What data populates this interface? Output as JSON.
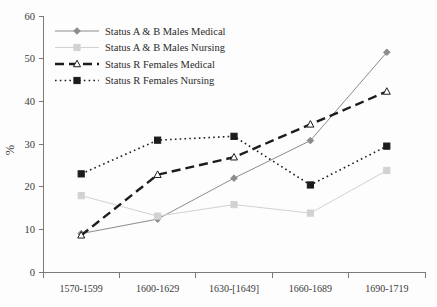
{
  "chart_data": {
    "type": "line",
    "title": "",
    "subtitle": "",
    "xlabel": "",
    "ylabel": "%",
    "categories": [
      "1570-1599",
      "1600-1629",
      "1630-[1649]",
      "1660-1689",
      "1690-1719"
    ],
    "ylim": [
      0,
      60
    ],
    "yticks": [
      0,
      10,
      20,
      30,
      40,
      50,
      60
    ],
    "ytick_labels": [
      "0",
      "10",
      "20",
      "30",
      "40",
      "50",
      "60"
    ],
    "grid": false,
    "legend_position": "top-left",
    "series": [
      {
        "name": "Status A & B Males Medical",
        "values": [
          9.0,
          12.4,
          22.0,
          30.8,
          51.5
        ],
        "color": "#8c8c8c",
        "line_style": "solid",
        "line_width": 1,
        "marker": "diamond",
        "marker_filled": true
      },
      {
        "name": "Status A & B Males Nursing",
        "values": [
          17.9,
          13.1,
          15.8,
          13.8,
          23.8
        ],
        "color": "#d2d2d2",
        "line_style": "solid",
        "line_width": 1,
        "marker": "square",
        "marker_filled": true
      },
      {
        "name": "Status R Females Medical",
        "values": [
          8.6,
          22.8,
          26.9,
          34.6,
          42.3
        ],
        "color": "#1c1c1c",
        "line_style": "dashed",
        "line_width": 2.4,
        "marker": "triangle",
        "marker_filled": false
      },
      {
        "name": "Status R Females Nursing",
        "values": [
          23.0,
          30.9,
          31.8,
          20.4,
          29.5
        ],
        "color": "#1c1c1c",
        "line_style": "dotted",
        "line_width": 1.6,
        "marker": "square",
        "marker_filled": true
      }
    ]
  },
  "legend": {
    "items": [
      {
        "label": "Status A & B Males Medical"
      },
      {
        "label": "Status A & B Males Nursing"
      },
      {
        "label": "Status R Females Medical"
      },
      {
        "label": "Status R Females Nursing"
      }
    ]
  },
  "axes": {
    "y_title": "%"
  }
}
